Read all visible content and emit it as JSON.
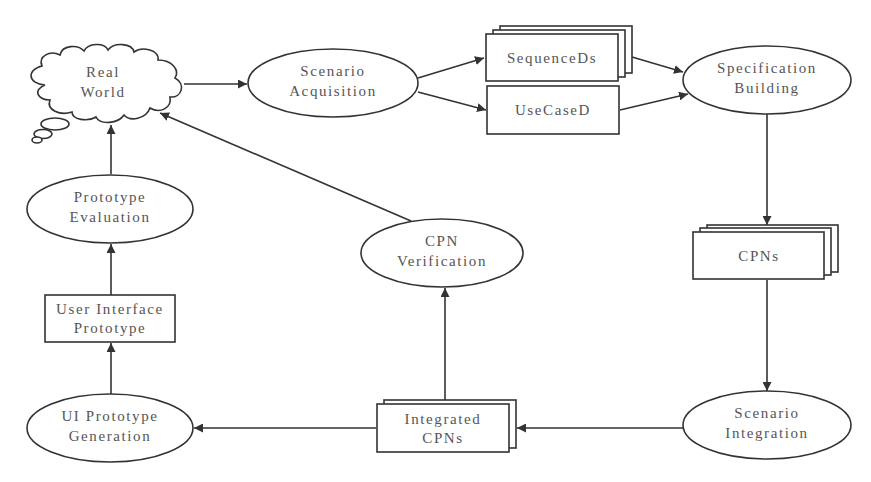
{
  "diagram": {
    "nodes": {
      "real_world": {
        "line1": "Real",
        "line2": "World",
        "shape": "cloud"
      },
      "scenario_acquisition": {
        "line1": "Scenario",
        "line2": "Acquisition",
        "shape": "ellipse"
      },
      "sequence_ds": {
        "label": "SequenceDs",
        "shape": "stacked-rect"
      },
      "use_case_d": {
        "label": "UseCaseD",
        "shape": "rect"
      },
      "specification_building": {
        "line1": "Specification",
        "line2": "Building",
        "shape": "ellipse"
      },
      "cpns": {
        "label": "CPNs",
        "shape": "stacked-rect"
      },
      "scenario_integration": {
        "line1": "Scenario",
        "line2": "Integration",
        "shape": "ellipse"
      },
      "integrated_cpns": {
        "line1": "Integrated",
        "line2": "CPNs",
        "shape": "stacked-rect"
      },
      "cpn_verification": {
        "line1": "CPN",
        "line2": "Verification",
        "shape": "ellipse"
      },
      "ui_prototype_generation": {
        "line1": "UI Prototype",
        "line2": "Generation",
        "shape": "ellipse"
      },
      "user_interface_prototype": {
        "line1": "User Interface",
        "line2": "Prototype",
        "shape": "rect"
      },
      "prototype_evaluation": {
        "line1": "Prototype",
        "line2": "Evaluation",
        "shape": "ellipse"
      }
    },
    "edges": [
      {
        "from": "Real World",
        "to": "Scenario Acquisition"
      },
      {
        "from": "Scenario Acquisition",
        "to": "SequenceDs"
      },
      {
        "from": "Scenario Acquisition",
        "to": "UseCaseD"
      },
      {
        "from": "SequenceDs",
        "to": "Specification Building"
      },
      {
        "from": "UseCaseD",
        "to": "Specification Building"
      },
      {
        "from": "Specification Building",
        "to": "CPNs"
      },
      {
        "from": "CPNs",
        "to": "Scenario Integration"
      },
      {
        "from": "Scenario Integration",
        "to": "Integrated CPNs"
      },
      {
        "from": "Integrated CPNs",
        "to": "CPN Verification"
      },
      {
        "from": "CPN Verification",
        "to": "Real World"
      },
      {
        "from": "Integrated CPNs",
        "to": "UI Prototype Generation"
      },
      {
        "from": "UI Prototype Generation",
        "to": "User Interface Prototype"
      },
      {
        "from": "User Interface Prototype",
        "to": "Prototype Evaluation"
      },
      {
        "from": "Prototype Evaluation",
        "to": "Real World"
      }
    ]
  }
}
